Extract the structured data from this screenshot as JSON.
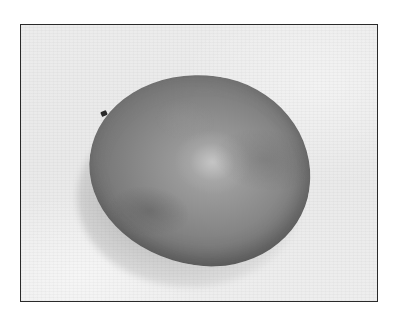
{
  "image": {
    "subject": "mango",
    "style": "grayscale photograph",
    "border_color": "#2a2a2a",
    "background_color": "#ececec"
  }
}
